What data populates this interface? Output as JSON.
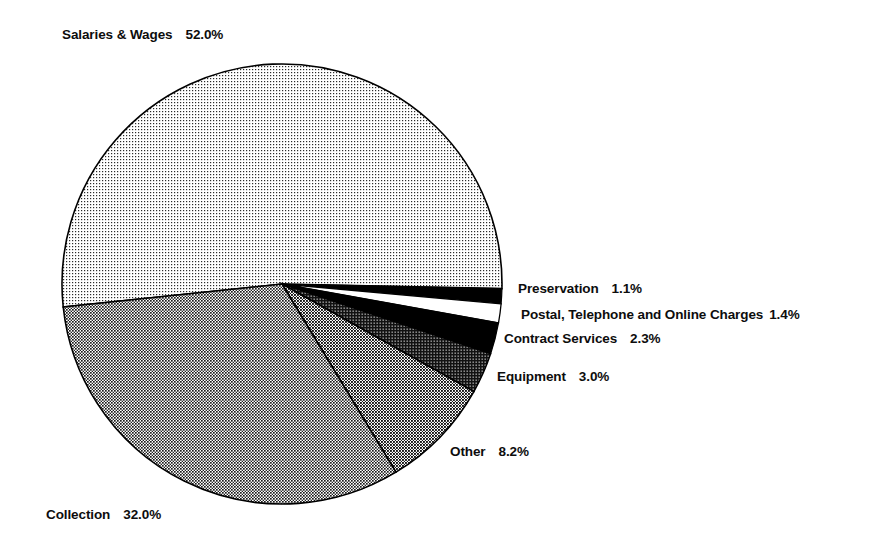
{
  "chart_data": {
    "type": "pie",
    "title": "",
    "subtitle": "",
    "xlabel": "",
    "ylabel": "",
    "legend_position": "none",
    "grid": false,
    "value_unit": "percent",
    "start_angle_deg": -186,
    "direction": "clockwise",
    "categories": [
      "Salaries & Wages",
      "Preservation",
      "Postal, Telephone and Online Charges",
      "Contract Services",
      "Equipment",
      "Other",
      "Collection"
    ],
    "values": [
      52.0,
      1.1,
      1.4,
      2.3,
      3.0,
      8.2,
      32.0
    ],
    "slices": [
      {
        "name": "Salaries & Wages",
        "value": 52.0,
        "value_label": "52.0%",
        "fill": "light-dotted",
        "color": "#d8d8d8"
      },
      {
        "name": "Preservation",
        "value": 1.1,
        "value_label": "1.1%",
        "fill": "solid-black",
        "color": "#000000"
      },
      {
        "name": "Postal, Telephone and Online Charges",
        "value": 1.4,
        "value_label": "1.4%",
        "fill": "solid-white",
        "color": "#ffffff"
      },
      {
        "name": "Contract Services",
        "value": 2.3,
        "value_label": "2.3%",
        "fill": "solid-black",
        "color": "#000000"
      },
      {
        "name": "Equipment",
        "value": 3.0,
        "value_label": "3.0%",
        "fill": "dark-hatch",
        "color": "#595959"
      },
      {
        "name": "Other",
        "value": 8.2,
        "value_label": "8.2%",
        "fill": "medium-check",
        "color": "#8f8f8f"
      },
      {
        "name": "Collection",
        "value": 32.0,
        "value_label": "32.0%",
        "fill": "medium-check",
        "color": "#9a9a9a"
      }
    ]
  },
  "labels": {
    "salaries": {
      "name": "Salaries & Wages",
      "value": "52.0%"
    },
    "preservation": {
      "name": "Preservation",
      "value": "1.1%"
    },
    "postal": {
      "name": "Postal, Telephone and Online Charges",
      "value": "1.4%"
    },
    "contract": {
      "name": "Contract Services",
      "value": "2.3%"
    },
    "equipment": {
      "name": "Equipment",
      "value": "3.0%"
    },
    "other": {
      "name": "Other",
      "value": "8.2%"
    },
    "collection": {
      "name": "Collection",
      "value": "32.0%"
    }
  }
}
